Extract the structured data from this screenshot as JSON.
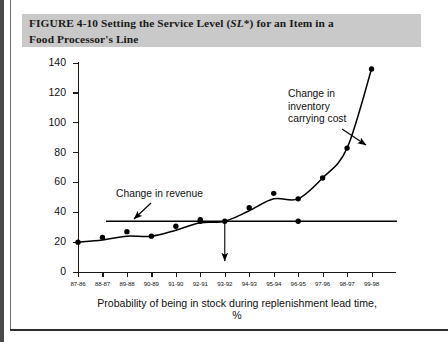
{
  "figure": {
    "caption_prefix": "FIGURE 4-10",
    "caption_main_a": "  Setting the Service Level (",
    "caption_italic": "SL",
    "caption_main_b": "*) for an Item in a",
    "caption_line2": "Food Processor's Line"
  },
  "chart_data": {
    "type": "scatter",
    "title": "Setting the Service Level (SL*) for an Item in a Food Processor's Line",
    "xlabel": "Probability of being in stock during replenishment lead time, %",
    "ylabel": "Change in revenue or cost, $/year",
    "categories": [
      "87-86",
      "88-87",
      "89-88",
      "90-89",
      "91-90",
      "92-91",
      "93-92",
      "94-93",
      "95-94",
      "96-95",
      "97-96",
      "98-97",
      "99-98"
    ],
    "ylim": [
      0,
      140
    ],
    "yticks": [
      0,
      20,
      40,
      60,
      80,
      100,
      120,
      140
    ],
    "grid": false,
    "legend": "none",
    "series": [
      {
        "name": "Change in inventory carrying cost",
        "type": "scatter+curve",
        "values": [
          20,
          21.5,
          24,
          24,
          28,
          33,
          34,
          41,
          49,
          49,
          63,
          83,
          136
        ]
      },
      {
        "name": "Change in revenue",
        "type": "line",
        "values": [
          34,
          34,
          34,
          34,
          34,
          34,
          34,
          34,
          34,
          34,
          34,
          34,
          34
        ]
      }
    ],
    "annotations": [
      {
        "name": "change-in-revenue",
        "text": "Change in revenue",
        "lines": [
          "Change in revenue"
        ]
      },
      {
        "name": "change-in-inventory-carrying-cost",
        "text": "Change in inventory carrying cost",
        "lines": [
          "Change in",
          "inventory",
          "carrying cost"
        ]
      },
      {
        "name": "service-level-marker",
        "text": "",
        "at_category": "93-92"
      }
    ],
    "colors": {
      "axis": "#1a1a1a",
      "marker": "#000000",
      "curve": "#000000",
      "revenue_line": "#000000",
      "caption_band": "#c9c9c9"
    }
  }
}
